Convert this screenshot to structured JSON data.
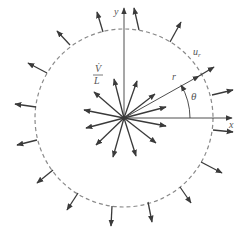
{
  "diagram": {
    "colors": {
      "line": "#3a3a3a",
      "dashed_circle": "#8a8a8a",
      "label": "#555555",
      "background": "#ffffff"
    },
    "origin": [
      124,
      118
    ],
    "circle_radius": 89,
    "labels": {
      "y_axis": "y",
      "x_axis": "x",
      "radial_velocity": "u",
      "radial_velocity_sub": "r",
      "radius": "r",
      "angle": "θ",
      "source_strength_num": "V̇",
      "source_strength_den": "L"
    },
    "inner_arrow_count": 16,
    "outer_arrow_count": 16
  }
}
